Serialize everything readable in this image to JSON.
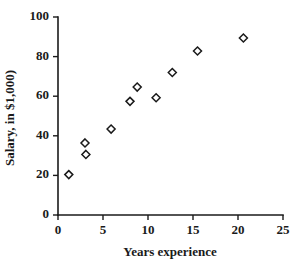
{
  "chart_data": {
    "type": "scatter",
    "title": "",
    "xlabel": "Years experience",
    "ylabel": "Salary, in $1,000)",
    "xlim": [
      0,
      25
    ],
    "ylim": [
      0,
      100
    ],
    "xticks": [
      0,
      5,
      10,
      15,
      20,
      25
    ],
    "yticks": [
      0,
      20,
      40,
      60,
      80,
      100
    ],
    "xtick_labels": [
      "0",
      "5",
      "10",
      "15",
      "20",
      "25"
    ],
    "ytick_labels": [
      "0",
      "20",
      "40",
      "60",
      "80",
      "100"
    ],
    "grid": false,
    "legend": false,
    "marker": "open-diamond",
    "marker_color": "#1a1a1a",
    "marker_fill": "#ffffff",
    "axis_color": "#1a1a1a",
    "background": "#ffffff",
    "points": [
      {
        "x": 1.2,
        "y": 20.4
      },
      {
        "x": 3.0,
        "y": 36.4
      },
      {
        "x": 3.1,
        "y": 30.6
      },
      {
        "x": 5.9,
        "y": 43.4
      },
      {
        "x": 8.0,
        "y": 57.4
      },
      {
        "x": 8.8,
        "y": 64.6
      },
      {
        "x": 10.9,
        "y": 59.2
      },
      {
        "x": 12.7,
        "y": 72.0
      },
      {
        "x": 15.5,
        "y": 82.8
      },
      {
        "x": 20.6,
        "y": 89.4
      }
    ]
  }
}
